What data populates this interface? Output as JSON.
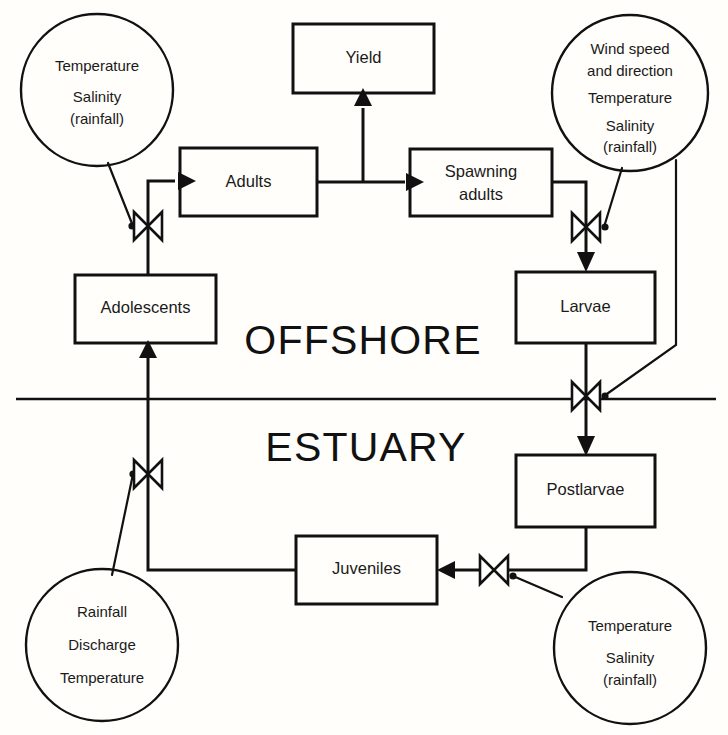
{
  "diagram": {
    "regions": [
      {
        "id": "offshore",
        "label": "OFFSHORE"
      },
      {
        "id": "estuary",
        "label": "ESTUARY"
      }
    ],
    "boxes": [
      {
        "id": "yield",
        "label": "Yield",
        "lines": [
          "Yield"
        ]
      },
      {
        "id": "adults",
        "label": "Adults",
        "lines": [
          "Adults"
        ]
      },
      {
        "id": "spawning-adults",
        "label": "Spawning adults",
        "lines": [
          "Spawning",
          "adults"
        ]
      },
      {
        "id": "larvae",
        "label": "Larvae",
        "lines": [
          "Larvae"
        ]
      },
      {
        "id": "postlarvae",
        "label": "Postlarvae",
        "lines": [
          "Postlarvae"
        ]
      },
      {
        "id": "juveniles",
        "label": "Juveniles",
        "lines": [
          "Juveniles"
        ]
      },
      {
        "id": "adolescents",
        "label": "Adolescents",
        "lines": [
          "Adolescents"
        ]
      }
    ],
    "circles": [
      {
        "id": "circle-top-left",
        "lines": [
          "Temperature",
          "Salinity",
          "(rainfall)"
        ]
      },
      {
        "id": "circle-top-right",
        "lines": [
          "Wind speed",
          "and direction",
          "Temperature",
          "Salinity",
          "(rainfall)"
        ]
      },
      {
        "id": "circle-bottom-left",
        "lines": [
          "Rainfall",
          "Discharge",
          "Temperature"
        ]
      },
      {
        "id": "circle-bottom-right",
        "lines": [
          "Temperature",
          "Salinity",
          "(rainfall)"
        ]
      }
    ],
    "valves": [
      {
        "id": "valve-adolescents-to-adults"
      },
      {
        "id": "valve-spawning-to-larvae"
      },
      {
        "id": "valve-larvae-to-postlarvae"
      },
      {
        "id": "valve-postlarvae-to-juveniles"
      },
      {
        "id": "valve-juveniles-to-adolescents"
      }
    ],
    "colors": {
      "stroke": "#111111",
      "background": "#fffefb",
      "text": "#1a1a1a"
    }
  }
}
